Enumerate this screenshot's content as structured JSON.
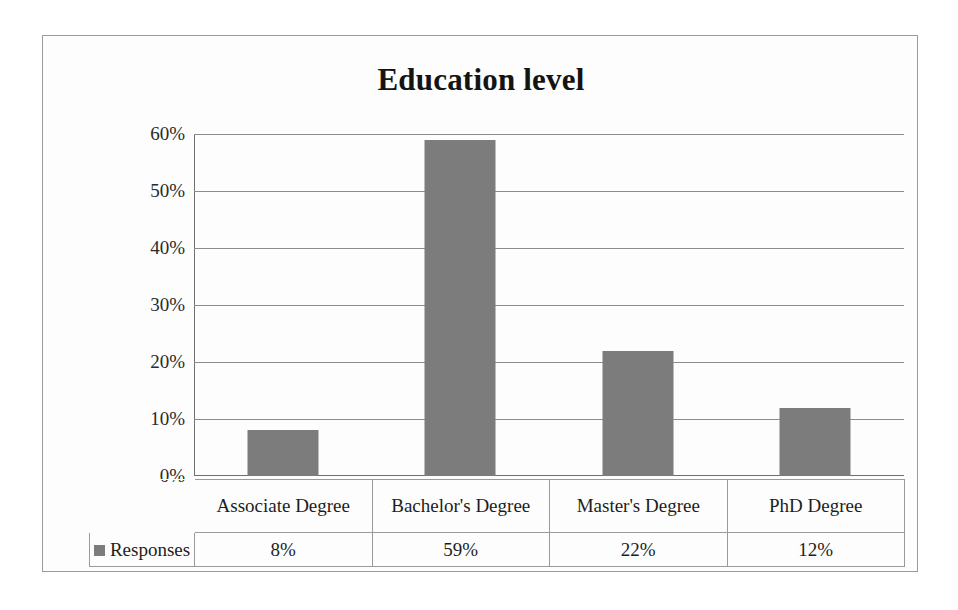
{
  "chart_data": {
    "type": "bar",
    "title": "Education level",
    "xlabel": "",
    "ylabel": "",
    "categories": [
      "Associate Degree",
      "Bachelor's Degree",
      "Master's Degree",
      "PhD Degree"
    ],
    "values": [
      8,
      59,
      22,
      12
    ],
    "value_labels": [
      "8%",
      "59%",
      "22%",
      "12%"
    ],
    "series": [
      {
        "name": "Responses",
        "values": [
          8,
          59,
          22,
          12
        ]
      }
    ],
    "ylim": [
      0,
      60
    ],
    "ytick_labels": [
      "60%",
      "50%",
      "40%",
      "30%",
      "20%",
      "10%",
      "0%"
    ],
    "ytick_values": [
      60,
      50,
      40,
      30,
      20,
      10,
      0
    ],
    "grid": true,
    "legend_position": "data-table-row",
    "bar_color": "#7c7c7c",
    "gridline_color": "#8c8c8c",
    "text_color": "#1d1d1d",
    "background_color": "#fdfdfd"
  },
  "table": {
    "legend_label": "Responses",
    "category_row": [
      "Associate Degree",
      "Bachelor's Degree",
      "Master's Degree",
      "PhD Degree"
    ],
    "value_row": [
      "8%",
      "59%",
      "22%",
      "12%"
    ]
  }
}
